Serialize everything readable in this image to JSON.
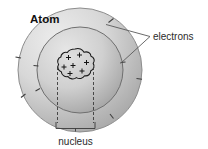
{
  "figure": {
    "title": "Atom",
    "kind": "labelled-science-diagram",
    "background_color": "#ffffff"
  },
  "labels": {
    "electrons": "electrons",
    "nucleus": "nucleus"
  },
  "parts": {
    "outer_shell": {
      "name": "outer electron shell",
      "center_x": 80,
      "center_y": 70,
      "radius": 62,
      "fill_light": "#e8e8e8",
      "fill_dark": "#a8a8a8",
      "stroke": "#8a8a8a"
    },
    "inner_shell": {
      "name": "inner electron shell",
      "center_x": 80,
      "center_y": 70,
      "radius": 43,
      "fill_light": "#e2e2e2",
      "fill_dark": "#9e9e9e",
      "stroke": "#6f6f6f"
    },
    "nucleus": {
      "name": "nucleus",
      "center_x": 75,
      "center_y": 67,
      "radius": 17,
      "fill": "#d2d2d2",
      "stroke": "#1c1c1c",
      "charge_symbol": "+",
      "charge_count": 7
    },
    "electron_ticks": {
      "name": "electron tick marks",
      "stroke": "#3a3a3a",
      "count": 8
    },
    "leader_lines": {
      "name": "electrons leader lines",
      "stroke": "#555555",
      "count": 2
    },
    "nucleus_callout": {
      "name": "nucleus measure bracket",
      "stroke": "#333333",
      "dash_pattern": "3 2"
    }
  }
}
